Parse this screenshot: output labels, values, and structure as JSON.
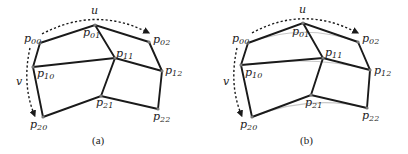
{
  "figure": {
    "panels": [
      {
        "caption": "(a)",
        "param_u": "u",
        "param_v": "v",
        "points": {
          "p00": {
            "label": "p00",
            "base": "p",
            "sub": "00"
          },
          "p01": {
            "label": "p01",
            "base": "p",
            "sub": "01"
          },
          "p02": {
            "label": "p02",
            "base": "p",
            "sub": "02"
          },
          "p10": {
            "label": "p10",
            "base": "p",
            "sub": "10"
          },
          "p11": {
            "label": "p11",
            "base": "p",
            "sub": "11"
          },
          "p12": {
            "label": "p12",
            "base": "p",
            "sub": "12"
          },
          "p20": {
            "label": "p20",
            "base": "p",
            "sub": "20"
          },
          "p21": {
            "label": "p21",
            "base": "p",
            "sub": "21"
          },
          "p22": {
            "label": "p22",
            "base": "p",
            "sub": "22"
          }
        },
        "description": "3x3 control point grid connected as a quadrilateral mesh"
      },
      {
        "caption": "(b)",
        "param_u": "u",
        "param_v": "v",
        "points": {
          "p00": {
            "label": "p00",
            "base": "p",
            "sub": "00"
          },
          "p01": {
            "label": "p01",
            "base": "p",
            "sub": "01"
          },
          "p02": {
            "label": "p02",
            "base": "p",
            "sub": "02"
          },
          "p10": {
            "label": "p10",
            "base": "p",
            "sub": "10"
          },
          "p11": {
            "label": "p11",
            "base": "p",
            "sub": "11"
          },
          "p12": {
            "label": "p12",
            "base": "p",
            "sub": "12"
          },
          "p20": {
            "label": "p20",
            "base": "p",
            "sub": "20"
          },
          "p21": {
            "label": "p21",
            "base": "p",
            "sub": "21"
          },
          "p22": {
            "label": "p22",
            "base": "p",
            "sub": "22"
          }
        },
        "description": "Same control mesh with light gray interpolating curves along u for each row"
      }
    ],
    "colors": {
      "edge": "#1a1a1a",
      "curve": "#c8c8c8",
      "point": "#777777",
      "text": "#222222"
    }
  }
}
